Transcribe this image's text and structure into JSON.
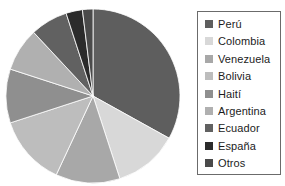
{
  "chart_data": {
    "type": "pie",
    "title": "",
    "xlabel": "",
    "ylabel": "",
    "legend_position": "right",
    "grid": false,
    "start_angle_deg": 0,
    "direction": "clockwise",
    "categories": [
      "Perú",
      "Colombia",
      "Venezuela",
      "Bolivia",
      "Haití",
      "Argentina",
      "Ecuador",
      "España",
      "Otros"
    ],
    "values": [
      33,
      12,
      12,
      13,
      10,
      8,
      7,
      3,
      2
    ],
    "units": "percent",
    "slices": [
      {
        "label": "Perú",
        "value": 33,
        "color": "#5e5e5e",
        "start_deg": 0,
        "end_deg": 119
      },
      {
        "label": "Colombia",
        "value": 12,
        "color": "#d8d8d8",
        "start_deg": 119,
        "end_deg": 162
      },
      {
        "label": "Venezuela",
        "value": 12,
        "color": "#a8a8a8",
        "start_deg": 162,
        "end_deg": 205
      },
      {
        "label": "Bolivia",
        "value": 13,
        "color": "#bdbdbd",
        "start_deg": 205,
        "end_deg": 252
      },
      {
        "label": "Haití",
        "value": 10,
        "color": "#8f8f8f",
        "start_deg": 252,
        "end_deg": 288
      },
      {
        "label": "Argentina",
        "value": 8,
        "color": "#b0b0b0",
        "start_deg": 288,
        "end_deg": 317
      },
      {
        "label": "Ecuador",
        "value": 7,
        "color": "#616161",
        "start_deg": 317,
        "end_deg": 342
      },
      {
        "label": "España",
        "value": 3,
        "color": "#2b2b2b",
        "start_deg": 342,
        "end_deg": 353
      },
      {
        "label": "Otros",
        "value": 2,
        "color": "#4a4a4a",
        "start_deg": 353,
        "end_deg": 360
      }
    ]
  },
  "legend": {
    "items": [
      {
        "label": "Perú",
        "color": "#5e5e5e",
        "swatch_icon": "legend-swatch-icon"
      },
      {
        "label": "Colombia",
        "color": "#d8d8d8",
        "swatch_icon": "legend-swatch-icon"
      },
      {
        "label": "Venezuela",
        "color": "#a8a8a8",
        "swatch_icon": "legend-swatch-icon"
      },
      {
        "label": "Bolivia",
        "color": "#bdbdbd",
        "swatch_icon": "legend-swatch-icon"
      },
      {
        "label": "Haití",
        "color": "#8f8f8f",
        "swatch_icon": "legend-swatch-icon"
      },
      {
        "label": "Argentina",
        "color": "#b0b0b0",
        "swatch_icon": "legend-swatch-icon"
      },
      {
        "label": "Ecuador",
        "color": "#616161",
        "swatch_icon": "legend-swatch-icon"
      },
      {
        "label": "España",
        "color": "#2b2b2b",
        "swatch_icon": "legend-swatch-icon"
      },
      {
        "label": "Otros",
        "color": "#4a4a4a",
        "swatch_icon": "legend-swatch-icon"
      }
    ]
  },
  "geometry": {
    "center_x": 93,
    "center_y": 96,
    "radius": 87
  }
}
